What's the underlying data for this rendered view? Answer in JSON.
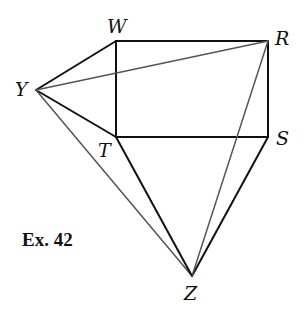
{
  "figure": {
    "caption": "Ex. 42",
    "points": {
      "W": {
        "label": "W",
        "x": 116,
        "y": 41
      },
      "R": {
        "label": "R",
        "x": 268,
        "y": 41
      },
      "S": {
        "label": "S",
        "x": 268,
        "y": 137
      },
      "T": {
        "label": "T",
        "x": 116,
        "y": 137
      },
      "Y": {
        "label": "Y",
        "x": 36,
        "y": 90
      },
      "Z": {
        "label": "Z",
        "x": 192,
        "y": 276
      }
    },
    "segments": [
      {
        "from": "W",
        "to": "R",
        "style": "dark"
      },
      {
        "from": "R",
        "to": "S",
        "style": "dark"
      },
      {
        "from": "S",
        "to": "T",
        "style": "dark"
      },
      {
        "from": "T",
        "to": "W",
        "style": "dark"
      },
      {
        "from": "Y",
        "to": "W",
        "style": "dark"
      },
      {
        "from": "Y",
        "to": "T",
        "style": "dark"
      },
      {
        "from": "Y",
        "to": "R",
        "style": "gray"
      },
      {
        "from": "Y",
        "to": "Z",
        "style": "gray"
      },
      {
        "from": "T",
        "to": "Z",
        "style": "dark"
      },
      {
        "from": "S",
        "to": "Z",
        "style": "dark"
      },
      {
        "from": "R",
        "to": "Z",
        "style": "gray"
      }
    ],
    "colors": {
      "dark_line": "#111111",
      "gray_line": "#555555",
      "background": "#ffffff"
    }
  }
}
